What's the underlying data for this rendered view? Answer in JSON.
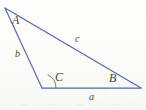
{
  "figure": {
    "kind": "triangle-diagram",
    "background_color": "#fdfdfb",
    "stroke_color": "#5566a8",
    "label_color": "#454545",
    "stroke_width": 1.1,
    "vertices": [
      {
        "name": "A",
        "label": "A",
        "x": 5,
        "y": 8
      },
      {
        "name": "B",
        "label": "B",
        "x": 141,
        "y": 88
      },
      {
        "name": "C",
        "label": "C",
        "x": 42,
        "y": 88
      }
    ],
    "sides": [
      {
        "name": "a",
        "label": "a",
        "from": "C",
        "to": "B",
        "opposite_vertex": "A"
      },
      {
        "name": "b",
        "label": "b",
        "from": "A",
        "to": "C",
        "opposite_vertex": "B"
      },
      {
        "name": "c",
        "label": "c",
        "from": "A",
        "to": "B",
        "opposite_vertex": "C"
      }
    ],
    "angle_marks": [
      {
        "at_vertex": "C",
        "style": "single-arc",
        "radius": 13
      }
    ],
    "bleed_through_text": "·· ·—· ·· —·· ·—·· ·· —· ··· ·—"
  }
}
